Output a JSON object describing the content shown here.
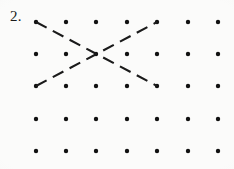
{
  "page": {
    "label": "2.",
    "background_color": "#fbfbfa",
    "ink_color": "#111111",
    "width": 234,
    "height": 169
  },
  "dot_grid": {
    "rows": 5,
    "columns": 7,
    "dot_radius": 2.2,
    "column_x": [
      36,
      66,
      96,
      127,
      157,
      188,
      218
    ],
    "row_y": [
      22,
      54,
      86,
      119,
      151
    ],
    "dot_color": "#111111"
  },
  "dashed_lines": [
    {
      "name": "diagonal-down-right",
      "from": {
        "column": 1,
        "row": 1,
        "x": 36,
        "y": 22
      },
      "to": {
        "column": 5,
        "row": 3,
        "x": 157,
        "y": 86
      },
      "dash_length": 12,
      "gap_length": 7,
      "stroke_width": 2.1,
      "color": "#1a1a1a"
    },
    {
      "name": "diagonal-up-right",
      "from": {
        "column": 1,
        "row": 3,
        "x": 36,
        "y": 86
      },
      "to": {
        "column": 5,
        "row": 1,
        "x": 157,
        "y": 22
      },
      "dash_length": 12,
      "gap_length": 7,
      "stroke_width": 2.1,
      "color": "#1a1a1a"
    }
  ],
  "intersection": {
    "name": "x-crossing-point",
    "column": 3,
    "row": 2,
    "x": 96,
    "y": 54
  }
}
